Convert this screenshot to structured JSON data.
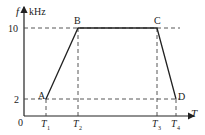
{
  "axes": {
    "y_label": "f",
    "y_unit": "kHz",
    "x_label": "T",
    "origin": "0",
    "y_ticks": [
      "10",
      "2"
    ],
    "x_ticks": [
      "T1",
      "T2",
      "T3",
      "T4"
    ]
  },
  "points": [
    {
      "label": "A",
      "x": "T1",
      "f": 2
    },
    {
      "label": "B",
      "x": "T2",
      "f": 10
    },
    {
      "label": "C",
      "x": "T3",
      "f": 10
    },
    {
      "label": "D",
      "x": "T4",
      "f": 2
    }
  ],
  "colors": {
    "line": "#222222",
    "dash": "#444444"
  }
}
